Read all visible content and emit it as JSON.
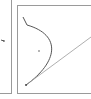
{
  "diagram": {
    "panels": [
      {
        "name": "left-panel",
        "content": "arrow-marker"
      },
      {
        "name": "right-panel",
        "content": "bezier-curve-with-tangent-line"
      }
    ],
    "colors": {
      "border": "#9a9a9a",
      "curve": "#555555",
      "tangent": "#9a9a9a",
      "point": "#333333",
      "background": "#ffffff"
    },
    "curve": {
      "start": [
        23,
        17
      ],
      "kink": [
        27,
        25
      ],
      "control": [
        62,
        45
      ],
      "end": [
        26,
        85
      ]
    },
    "center_point": [
      39,
      51
    ],
    "tangent_line": {
      "from": [
        26,
        85
      ],
      "to": [
        91,
        37
      ]
    },
    "left_marker": [
      3,
      40
    ]
  }
}
